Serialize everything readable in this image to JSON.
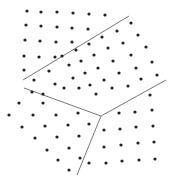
{
  "diagram": {
    "title": "",
    "colors": {
      "dot": "#222222",
      "boundary": "#777777",
      "background": "#ffffff"
    },
    "boundaries": [
      {
        "name": "boundary-upper",
        "x1": 23,
        "y1": 80,
        "x2": 129,
        "y2": 16
      },
      {
        "name": "boundary-left",
        "x1": 24,
        "y1": 88,
        "x2": 101,
        "y2": 116
      },
      {
        "name": "boundary-right",
        "x1": 101,
        "y1": 116,
        "x2": 166,
        "y2": 80
      },
      {
        "name": "boundary-bottom",
        "x1": 101,
        "y1": 116,
        "x2": 77,
        "y2": 175
      }
    ],
    "grains": [
      {
        "name": "grain-top-left",
        "dots": [
          [
            27,
            11
          ],
          [
            41,
            12
          ],
          [
            57,
            12
          ],
          [
            73,
            13
          ],
          [
            89,
            14
          ],
          [
            105,
            15
          ],
          [
            26,
            25
          ],
          [
            41,
            26
          ],
          [
            57,
            27
          ],
          [
            72,
            28
          ],
          [
            88,
            29
          ],
          [
            25,
            40
          ],
          [
            40,
            41
          ],
          [
            56,
            42
          ],
          [
            72,
            42
          ],
          [
            24,
            56
          ],
          [
            39,
            57
          ],
          [
            55,
            57
          ],
          [
            24,
            70
          ]
        ]
      },
      {
        "name": "grain-middle",
        "dots": [
          [
            131,
            23
          ],
          [
            138,
            35
          ],
          [
            146,
            47
          ],
          [
            152,
            62
          ],
          [
            157,
            75
          ],
          [
            117,
            31
          ],
          [
            123,
            43
          ],
          [
            131,
            55
          ],
          [
            136,
            68
          ],
          [
            141,
            79
          ],
          [
            102,
            37
          ],
          [
            108,
            48
          ],
          [
            113,
            61
          ],
          [
            119,
            73
          ],
          [
            128,
            86
          ],
          [
            89,
            44
          ],
          [
            94,
            55
          ],
          [
            98,
            68
          ],
          [
            104,
            80
          ],
          [
            112,
            88
          ],
          [
            76,
            50
          ],
          [
            81,
            61
          ],
          [
            85,
            73
          ],
          [
            90,
            85
          ],
          [
            96,
            94
          ],
          [
            62,
            56
          ],
          [
            69,
            65
          ],
          [
            73,
            78
          ],
          [
            79,
            88
          ],
          [
            49,
            71
          ],
          [
            55,
            84
          ],
          [
            64,
            88
          ],
          [
            34,
            80
          ]
        ]
      },
      {
        "name": "grain-bottom-left",
        "dots": [
          [
            32,
            92
          ],
          [
            43,
            94
          ],
          [
            19,
            103
          ],
          [
            43,
            103
          ],
          [
            9,
            115
          ],
          [
            33,
            115
          ],
          [
            56,
            115
          ],
          [
            78,
            113
          ],
          [
            22,
            127
          ],
          [
            45,
            126
          ],
          [
            68,
            125
          ],
          [
            89,
            124
          ],
          [
            35,
            138
          ],
          [
            57,
            137
          ],
          [
            79,
            136
          ],
          [
            47,
            150
          ],
          [
            69,
            148
          ],
          [
            58,
            160
          ],
          [
            80,
            158
          ],
          [
            69,
            170
          ]
        ]
      },
      {
        "name": "grain-bottom-right",
        "dots": [
          [
            150,
            95
          ],
          [
            119,
            113
          ],
          [
            135,
            112
          ],
          [
            152,
            110
          ],
          [
            104,
            130
          ],
          [
            120,
            129
          ],
          [
            136,
            127
          ],
          [
            153,
            126
          ],
          [
            104,
            147
          ],
          [
            121,
            145
          ],
          [
            138,
            143
          ],
          [
            154,
            142
          ],
          [
            89,
            163
          ],
          [
            106,
            163
          ],
          [
            122,
            161
          ],
          [
            139,
            160
          ],
          [
            155,
            159
          ]
        ]
      }
    ]
  }
}
